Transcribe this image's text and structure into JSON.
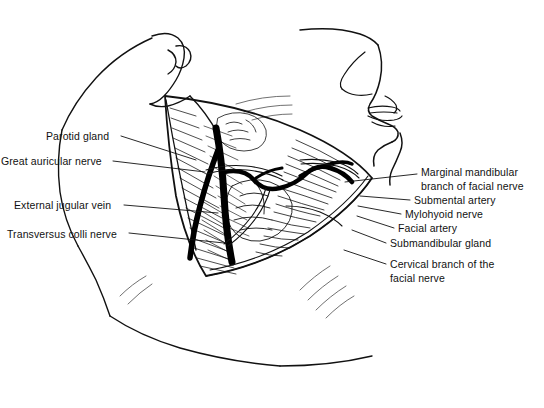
{
  "figure": {
    "type": "anatomical-line-illustration",
    "background_color": "#ffffff",
    "line_color": "#000000"
  },
  "labels_left": [
    {
      "id": "parotid-gland",
      "text": "Parotid gland",
      "x": 46,
      "y": 130,
      "leader_from": [
        121,
        136
      ],
      "leader_to": [
        196,
        160
      ]
    },
    {
      "id": "great-auricular-nerve",
      "text": "Great auricular nerve",
      "x": 1,
      "y": 155,
      "leader_from": [
        113,
        161
      ],
      "leader_to": [
        205,
        172
      ]
    },
    {
      "id": "external-jugular-vein",
      "text": "External jugular vein",
      "x": 14,
      "y": 199,
      "leader_from": [
        124,
        205
      ],
      "leader_to": [
        218,
        213
      ]
    },
    {
      "id": "transversus-colli-nerve",
      "text": "Transversus colli nerve",
      "x": 7,
      "y": 228,
      "leader_from": [
        129,
        233
      ],
      "leader_to": [
        224,
        243
      ]
    }
  ],
  "labels_right": [
    {
      "id": "marginal-mandibular-branch-of-facial-nerve",
      "text": "Marginal mandibular branch of facial nerve",
      "x": 421,
      "y": 166,
      "multiline": true,
      "leader_from": [
        417,
        174
      ],
      "leader_to": [
        345,
        182
      ]
    },
    {
      "id": "submental-artery",
      "text": "Submental artery",
      "x": 414,
      "y": 194,
      "leader_from": [
        410,
        200
      ],
      "leader_to": [
        360,
        196
      ]
    },
    {
      "id": "mylohyoid-nerve",
      "text": "Mylohyoid nerve",
      "x": 405,
      "y": 208,
      "leader_from": [
        401,
        214
      ],
      "leader_to": [
        358,
        206
      ]
    },
    {
      "id": "facial-artery",
      "text": "Facial artery",
      "x": 398,
      "y": 222,
      "leader_from": [
        394,
        228
      ],
      "leader_to": [
        357,
        216
      ]
    },
    {
      "id": "submandibular-gland",
      "text": "Submandibular gland",
      "x": 390,
      "y": 237,
      "leader_from": [
        386,
        243
      ],
      "leader_to": [
        352,
        230
      ]
    },
    {
      "id": "cervical-branch-of-the-facial-nerve",
      "text": "Cervical branch of the facial nerve",
      "x": 390,
      "y": 258,
      "multiline": true,
      "leader_from": [
        386,
        264
      ],
      "leader_to": [
        344,
        250
      ]
    }
  ]
}
